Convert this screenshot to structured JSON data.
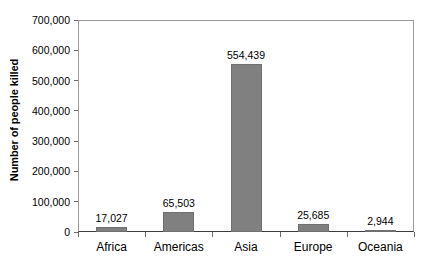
{
  "chart_data": {
    "type": "bar",
    "title": "",
    "subtitle": "",
    "xlabel": "",
    "ylabel": "Number of people killed",
    "categories": [
      "Africa",
      "Americas",
      "Asia",
      "Europe",
      "Oceania"
    ],
    "values": [
      17027,
      65503,
      554439,
      25685,
      2944
    ],
    "value_labels": [
      "17,027",
      "65,503",
      "554,439",
      "25,685",
      "2,944"
    ],
    "ylim": [
      0,
      700000
    ],
    "ytick_values": [
      0,
      100000,
      200000,
      300000,
      400000,
      500000,
      600000,
      700000
    ],
    "ytick_labels": [
      "0",
      "100,000",
      "200,000",
      "300,000",
      "400,000",
      "500,000",
      "600,000",
      "700,000"
    ],
    "grid": false,
    "legend": null,
    "bar_color": "#808080",
    "axis_color": "#3c3c3c",
    "frame_color": "#9a9a9a",
    "text_color": "#000000",
    "annotations": []
  }
}
